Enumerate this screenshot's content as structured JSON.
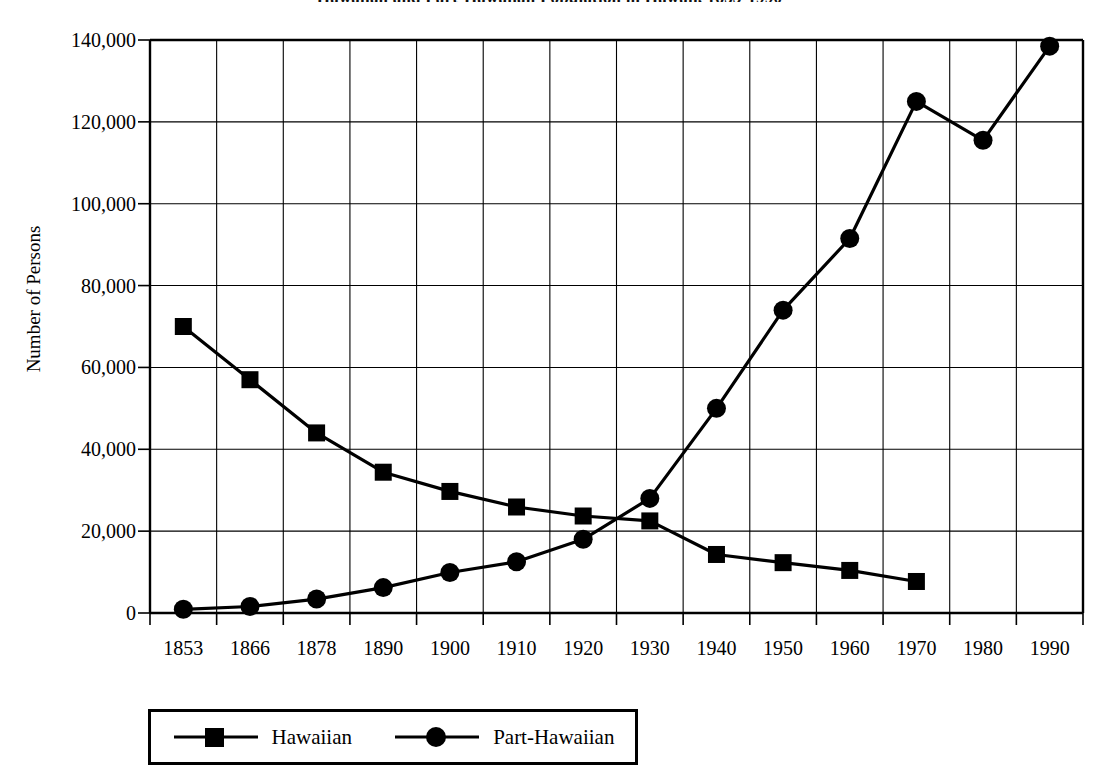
{
  "chart_data": {
    "type": "line",
    "title": "Hawaiian and Part-Hawaiian Population in Hawaii, 1853-1990",
    "xlabel": "",
    "ylabel": "Number of Persons",
    "categories": [
      "1853",
      "1866",
      "1878",
      "1890",
      "1900",
      "1910",
      "1920",
      "1930",
      "1940",
      "1950",
      "1960",
      "1970",
      "1980",
      "1990"
    ],
    "ylim": [
      0,
      140000
    ],
    "ytick_labels": [
      "0",
      "20,000",
      "40,000",
      "60,000",
      "80,000",
      "100,000",
      "120,000",
      "140,000"
    ],
    "ytick_values": [
      0,
      20000,
      40000,
      60000,
      80000,
      100000,
      120000,
      140000
    ],
    "grid": true,
    "legend_position": "bottom-left",
    "series": [
      {
        "name": "Hawaiian",
        "marker": "square",
        "color": "#000000",
        "values": [
          70000,
          57000,
          44000,
          34400,
          29700,
          25900,
          23700,
          22500,
          14300,
          12300,
          10400,
          7700,
          null,
          null
        ]
      },
      {
        "name": "Part-Hawaiian",
        "marker": "circle",
        "color": "#000000",
        "values": [
          900,
          1600,
          3400,
          6200,
          9900,
          12500,
          18000,
          28000,
          50000,
          74000,
          91500,
          125000,
          115500,
          138500
        ]
      }
    ]
  },
  "legend": {
    "entries": [
      {
        "label": "Hawaiian",
        "marker": "square-marker-icon"
      },
      {
        "label": "Part-Hawaiian",
        "marker": "circle-marker-icon"
      }
    ]
  }
}
